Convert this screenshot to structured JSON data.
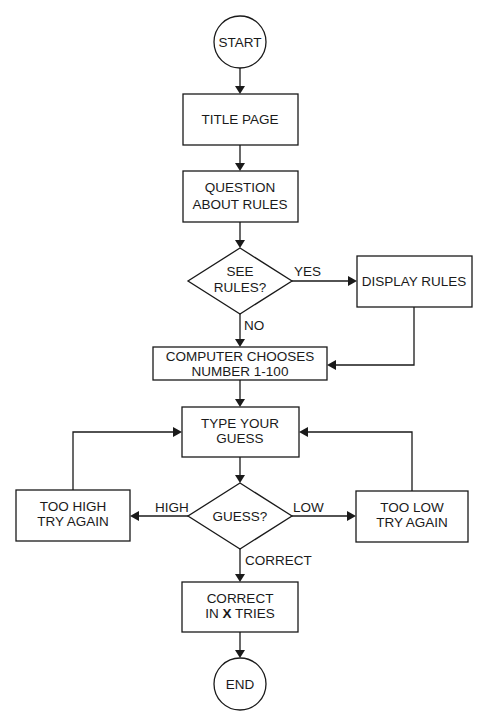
{
  "nodes": {
    "start": "START",
    "title_page": "TITLE PAGE",
    "question": {
      "line1": "QUESTION",
      "line2": "ABOUT RULES"
    },
    "see_rules": {
      "line1": "SEE",
      "line2": "RULES?"
    },
    "display_rules": "DISPLAY RULES",
    "computer_chooses": {
      "line1": "COMPUTER CHOOSES",
      "line2": "NUMBER 1-100"
    },
    "type_guess": {
      "line1": "TYPE YOUR",
      "line2": "GUESS"
    },
    "guess_decision": "GUESS?",
    "too_high": {
      "line1": "TOO HIGH",
      "line2": "TRY AGAIN"
    },
    "too_low": {
      "line1": "TOO LOW",
      "line2": "TRY AGAIN"
    },
    "correct": {
      "line1": "CORRECT",
      "line2_pre": "IN",
      "line2_var": "X",
      "line2_post": "TRIES"
    },
    "end": "END"
  },
  "edge_labels": {
    "yes": "YES",
    "no": "NO",
    "high": "HIGH",
    "low": "LOW",
    "correct": "CORRECT"
  }
}
